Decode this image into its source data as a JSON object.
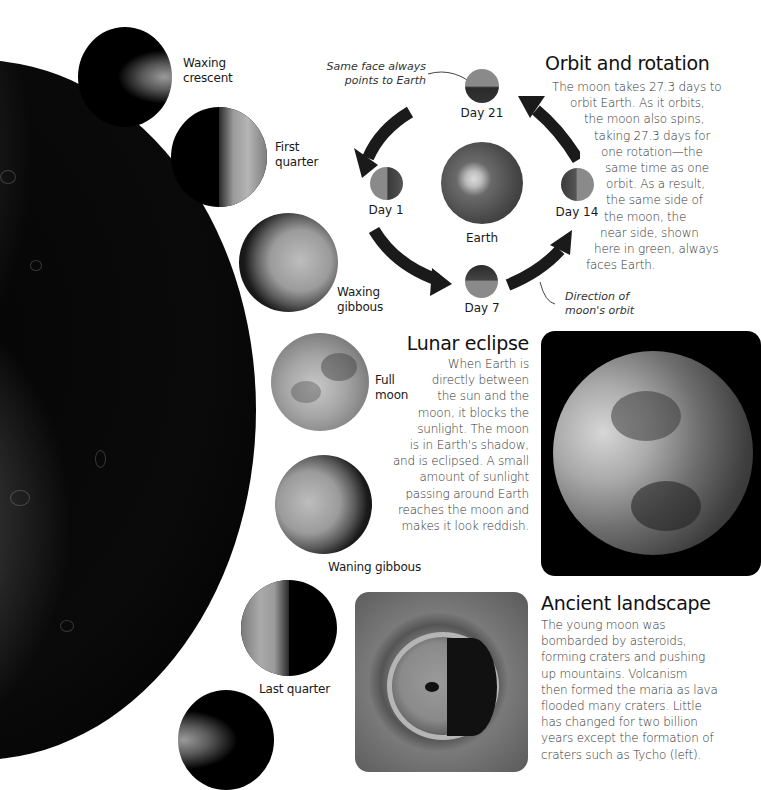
{
  "phases": [
    {
      "label_line1": "Waxing",
      "label_line2": "crescent"
    },
    {
      "label_line1": "First",
      "label_line2": "quarter"
    },
    {
      "label_line1": "Waxing",
      "label_line2": "gibbous"
    },
    {
      "label_line1": "Full",
      "label_line2": "moon"
    },
    {
      "label_line1": "Waning gibbous",
      "label_line2": ""
    },
    {
      "label_line1": "Last quarter",
      "label_line2": ""
    }
  ],
  "orbit_diagram": {
    "annotation_top_line1": "Same face always",
    "annotation_top_line2": "points to Earth",
    "annotation_bottom_line1": "Direction of",
    "annotation_bottom_line2": "moon's orbit",
    "earth_label": "Earth",
    "days": {
      "day21": "Day 21",
      "day1": "Day 1",
      "day7": "Day 7",
      "day14": "Day 14"
    },
    "near_side_color": "#7a9a5a"
  },
  "orbit_section": {
    "heading": "Orbit and rotation",
    "lines": [
      "The moon takes 27.3 days to",
      "orbit Earth. As it orbits,",
      "the moon also spins,",
      "taking 27.3 days for",
      "one rotation—the",
      "same time as one",
      "orbit. As a result,",
      "the same side of",
      "the moon, the",
      "near side, shown",
      "here in green, always",
      "faces Earth."
    ]
  },
  "eclipse_section": {
    "heading": "Lunar eclipse",
    "lines": [
      "When Earth is",
      "directly between",
      "the sun and the",
      "moon, it blocks the",
      "sunlight. The moon",
      "is in Earth's shadow,",
      "and is eclipsed. A small",
      "amount of sunlight",
      "passing around Earth",
      "reaches the moon and",
      "makes it look reddish."
    ]
  },
  "landscape_section": {
    "heading": "Ancient landscape",
    "lines": [
      "The young moon was",
      "bombarded by asteroids,",
      "forming craters and pushing",
      "up mountains. Volcanism",
      "then formed the maria as lava",
      "flooded many craters. Little",
      "has changed for two billion",
      "years except the formation of",
      "craters such as Tycho (left)."
    ]
  }
}
